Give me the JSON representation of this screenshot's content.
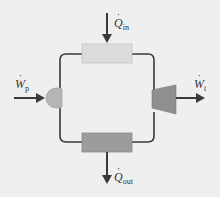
{
  "diagram": {
    "type": "rankine-cycle",
    "background": "#efefef",
    "line_color": "#3a3a3a",
    "components": {
      "boiler": {
        "name": "heat-addition-box",
        "color": "#dcdcdc"
      },
      "condenser": {
        "name": "heat-rejection-box",
        "color": "#9c9c9c"
      },
      "pump": {
        "name": "pump",
        "color": "#b5b5b5"
      },
      "turbine": {
        "name": "turbine",
        "color": "#8f8f8f"
      }
    },
    "labels": {
      "q_in": {
        "symbol": "Q",
        "sub": "in"
      },
      "q_out": {
        "symbol": "Q",
        "sub": "out"
      },
      "w_p": {
        "symbol": "W",
        "sub": "p"
      },
      "w_t": {
        "symbol": "W",
        "sub": "t"
      }
    }
  }
}
